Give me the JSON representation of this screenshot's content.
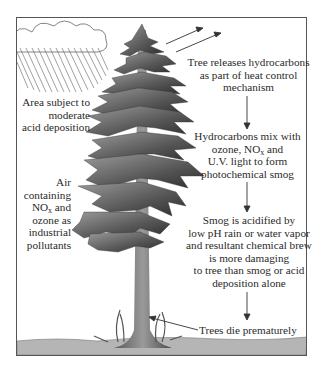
{
  "diagram": {
    "left_labels": {
      "acid_deposition": [
        "Area subject to",
        "moderate",
        "acid deposition"
      ],
      "air_pollutants": {
        "line1": "Air",
        "line2": "containing",
        "line3_prefix": "NO",
        "line3_sub": "x",
        "line3_suffix": " and",
        "line4": "ozone as",
        "line5": "industrial",
        "line6": "pollutants"
      }
    },
    "flow_steps": [
      {
        "id": "step1",
        "lines": [
          "Tree releases hydrocarbons",
          "as part of heat control",
          "mechanism"
        ]
      },
      {
        "id": "step2",
        "line1": "Hydrocarbons mix with",
        "line2_prefix": "ozone, NO",
        "line2_sub": "x",
        "line2_suffix": " and",
        "line3": "U.V. light to form",
        "line4": "photochemical smog"
      },
      {
        "id": "step3",
        "lines": [
          "Smog is acidified by",
          "low pH rain or water vapor",
          "and resultant chemical brew",
          "is more damaging",
          "to tree than smog or acid",
          "deposition alone"
        ]
      },
      {
        "id": "step4",
        "lines": [
          "Trees die prematurely"
        ]
      }
    ],
    "colors": {
      "frame": "#555555",
      "text": "#2a2a2a",
      "foliage_dark": "#3a3a3a",
      "foliage_mid": "#7a7a7a",
      "trunk": "#6e6e6e",
      "ground": "#b5b5b5",
      "rain": "#777777"
    }
  }
}
